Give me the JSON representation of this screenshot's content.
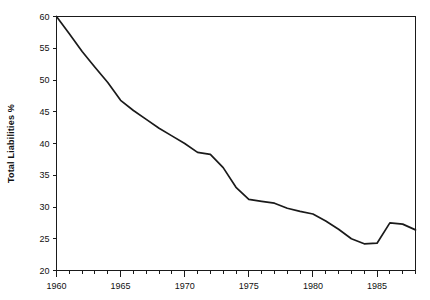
{
  "chart_data": {
    "type": "line",
    "title": "",
    "xlabel": "",
    "ylabel": "Total Liabilities %",
    "xlim": [
      1960,
      1988
    ],
    "ylim": [
      20,
      60
    ],
    "grid": false,
    "legend": "none",
    "x_ticks_major": [
      1960,
      1965,
      1970,
      1975,
      1980,
      1985
    ],
    "x_tick_labels": [
      "1960",
      "1965",
      "1970",
      "1975",
      "1980",
      "1985"
    ],
    "x_minor_tick_step": 1,
    "y_ticks": [
      20,
      25,
      30,
      35,
      40,
      45,
      50,
      55,
      60
    ],
    "y_tick_labels": [
      "20",
      "25",
      "30",
      "35",
      "40",
      "45",
      "50",
      "55",
      "60"
    ],
    "series": [
      {
        "name": "Total Liabilities %",
        "color": "#1a1a1a",
        "x": [
          1960,
          1961,
          1962,
          1963,
          1964,
          1965,
          1966,
          1967,
          1968,
          1969,
          1970,
          1971,
          1972,
          1973,
          1974,
          1975,
          1976,
          1977,
          1978,
          1979,
          1980,
          1981,
          1982,
          1983,
          1984,
          1985,
          1986,
          1987,
          1988
        ],
        "values": [
          60.0,
          57.3,
          54.5,
          52.0,
          49.6,
          46.8,
          45.2,
          43.8,
          42.4,
          41.2,
          40.0,
          38.6,
          38.3,
          36.2,
          33.1,
          31.2,
          30.9,
          30.6,
          29.8,
          29.3,
          28.9,
          27.8,
          26.5,
          25.0,
          24.2,
          24.3,
          27.5,
          27.3,
          26.4
        ]
      }
    ]
  },
  "axis_label": {
    "y_title": "Total Liabilities %"
  }
}
